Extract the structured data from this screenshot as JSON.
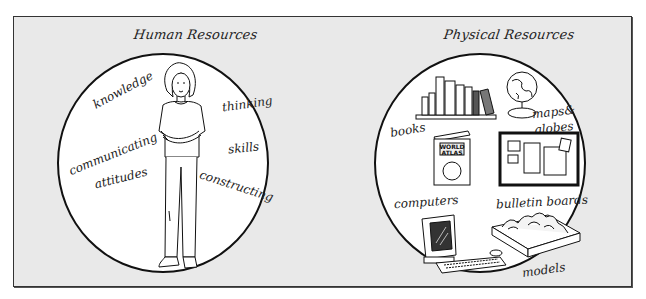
{
  "panels": [
    {
      "title": "Human Resources",
      "labels": [
        "knowledge",
        "thinking",
        "communicating",
        "skills",
        "attitudes",
        "constructing"
      ]
    },
    {
      "title": "Physical Resources",
      "labels": [
        "books",
        "maps&",
        "globes",
        "computers",
        "bulletin boards",
        "models"
      ]
    }
  ],
  "illustrations": {
    "left": "woman-standing-arms-crossed",
    "right": [
      "bookshelf",
      "globe",
      "world-atlas",
      "bulletin-board",
      "computer",
      "terrain-model"
    ]
  },
  "atlas_text": [
    "WORLD",
    "ATLAS"
  ],
  "colors": {
    "background": "#e9e9e9",
    "circle_fill": "#ffffff",
    "ink": "#111111",
    "frame_border": "#333333"
  }
}
